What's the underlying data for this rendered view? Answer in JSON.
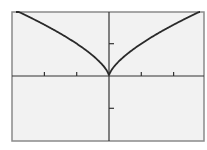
{
  "chart_data": {
    "type": "line",
    "title": "",
    "xlabel": "",
    "ylabel": "",
    "function": "y = x^(2/3)",
    "xlim": [
      -3,
      3
    ],
    "ylim": [
      -2,
      2
    ],
    "x_ticks": [
      -2,
      -1,
      1,
      2
    ],
    "y_ticks": [
      -1,
      1
    ],
    "grid": false,
    "legend": null,
    "series": [
      {
        "name": "y = x^(2/3)",
        "x": [
          -3,
          -2.5,
          -2,
          -1.5,
          -1,
          -0.5,
          -0.1,
          0,
          0.1,
          0.5,
          1,
          1.5,
          2,
          2.5,
          3
        ],
        "y": [
          2.08,
          1.84,
          1.59,
          1.31,
          1.0,
          0.63,
          0.22,
          0,
          0.22,
          0.63,
          1.0,
          1.31,
          1.59,
          1.84,
          2.08
        ]
      }
    ]
  },
  "colors": {
    "background": "#f2f2f2",
    "frame": "#8a8a8a",
    "axis": "#333333",
    "curve": "#2a2a2a"
  },
  "layout": {
    "frame": {
      "left": 12,
      "top": 12,
      "right": 204,
      "bottom": 141
    },
    "origin": {
      "x": 109,
      "y": 76
    },
    "unit_px": {
      "x": 32.3,
      "y": 32.3
    }
  }
}
